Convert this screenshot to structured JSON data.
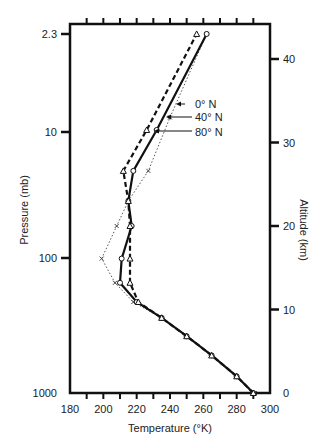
{
  "chart_data": {
    "type": "line",
    "title": "",
    "xlabel": "Temperature (°K)",
    "ylabel": "Pressure (mb)",
    "y2label": "Altitude (km)",
    "xlim": [
      180,
      300
    ],
    "ylim_altitude_km": [
      0,
      45
    ],
    "x_ticks": [
      180,
      200,
      220,
      240,
      260,
      280,
      300
    ],
    "x_minor_ticks": [
      190,
      200,
      210,
      220,
      230,
      240,
      250,
      260,
      270,
      280,
      290
    ],
    "y_left_ticks": [
      {
        "label": "2.3",
        "altitude_km": 43
      },
      {
        "label": "10",
        "altitude_km": 31.2
      },
      {
        "label": "100",
        "altitude_km": 16.1
      },
      {
        "label": "1000",
        "altitude_km": 0
      }
    ],
    "y_right_ticks": [
      0,
      10,
      20,
      30,
      40
    ],
    "grid": false,
    "legend_position": "inline annotations with arrows (upper middle)",
    "series": [
      {
        "name": "0° N",
        "style": "dotted",
        "marker": "x",
        "points": [
          {
            "T": 291,
            "alt": 0
          },
          {
            "T": 280,
            "alt": 2
          },
          {
            "T": 265,
            "alt": 4.5
          },
          {
            "T": 250,
            "alt": 6.8
          },
          {
            "T": 235,
            "alt": 9
          },
          {
            "T": 218,
            "alt": 10.9
          },
          {
            "T": 207,
            "alt": 13.2
          },
          {
            "T": 199,
            "alt": 16.1
          },
          {
            "T": 208,
            "alt": 20
          },
          {
            "T": 215,
            "alt": 23
          },
          {
            "T": 227,
            "alt": 26.6
          },
          {
            "T": 240,
            "alt": 33
          },
          {
            "T": 262,
            "alt": 43
          }
        ]
      },
      {
        "name": "40° N",
        "style": "solid",
        "marker": "circle",
        "points": [
          {
            "T": 290,
            "alt": 0
          },
          {
            "T": 280,
            "alt": 2
          },
          {
            "T": 265,
            "alt": 4.5
          },
          {
            "T": 250,
            "alt": 6.8
          },
          {
            "T": 235,
            "alt": 9
          },
          {
            "T": 220,
            "alt": 10.9
          },
          {
            "T": 210,
            "alt": 13.2
          },
          {
            "T": 211,
            "alt": 16.1
          },
          {
            "T": 217,
            "alt": 20
          },
          {
            "T": 215,
            "alt": 23
          },
          {
            "T": 218,
            "alt": 26.6
          },
          {
            "T": 232,
            "alt": 31.5
          },
          {
            "T": 262,
            "alt": 43
          }
        ]
      },
      {
        "name": "80° N",
        "style": "dashed",
        "marker": "triangle",
        "points": [
          {
            "T": 290,
            "alt": 0
          },
          {
            "T": 280,
            "alt": 2
          },
          {
            "T": 265,
            "alt": 4.5
          },
          {
            "T": 250,
            "alt": 6.8
          },
          {
            "T": 235,
            "alt": 9
          },
          {
            "T": 221,
            "alt": 10.9
          },
          {
            "T": 216,
            "alt": 13.2
          },
          {
            "T": 216,
            "alt": 16.1
          },
          {
            "T": 216,
            "alt": 20
          },
          {
            "T": 215,
            "alt": 23
          },
          {
            "T": 212,
            "alt": 26.6
          },
          {
            "T": 226,
            "alt": 31.5
          },
          {
            "T": 256,
            "alt": 43
          }
        ]
      }
    ],
    "annotations": [
      {
        "text": "0° N",
        "points_to": "0° N"
      },
      {
        "text": "40° N",
        "points_to": "40° N"
      },
      {
        "text": "80° N",
        "points_to": "80° N"
      }
    ]
  }
}
